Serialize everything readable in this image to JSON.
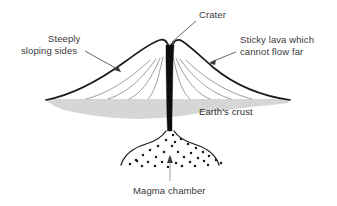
{
  "figure": {
    "background_color": "#ffffff",
    "width": 337,
    "height": 206
  },
  "labels": {
    "crater": "Crater",
    "steeply_line1": "Steeply",
    "steeply_line2": "sloping sides",
    "sticky_line1": "Sticky lava which",
    "sticky_line2": "cannot flow far",
    "earths_crust": "Earth's crust",
    "magma_chamber": "Magma chamber"
  },
  "colors": {
    "outline": "#1a1a1a",
    "crust_fill": "#d6d6d6",
    "vent_fill": "#0d0d0d",
    "layer_line": "#7d7d7d",
    "leader_line": "#8c8c8c",
    "text": "#3a3a3a"
  },
  "parts": {
    "cone_name": "volcano-cone",
    "vent_name": "volcanic-vent-conduit",
    "crust_name": "earths-crust-band",
    "chamber_name": "magma-chamber",
    "layers_name": "lava-layer-lines"
  },
  "magma_dots": [
    [
      173,
      135
    ],
    [
      166,
      140
    ],
    [
      181,
      139
    ],
    [
      158,
      146
    ],
    [
      172,
      146
    ],
    [
      188,
      144
    ],
    [
      196,
      148
    ],
    [
      150,
      150
    ],
    [
      164,
      152
    ],
    [
      178,
      152
    ],
    [
      191,
      153
    ],
    [
      203,
      152
    ],
    [
      143,
      155
    ],
    [
      156,
      157
    ],
    [
      170,
      158
    ],
    [
      184,
      157
    ],
    [
      198,
      158
    ],
    [
      209,
      156
    ],
    [
      136,
      160
    ],
    [
      148,
      162
    ],
    [
      162,
      162
    ],
    [
      176,
      163
    ],
    [
      190,
      162
    ],
    [
      204,
      161
    ],
    [
      216,
      160
    ],
    [
      130,
      164
    ],
    [
      142,
      166
    ],
    [
      155,
      166
    ],
    [
      168,
      167
    ],
    [
      182,
      166
    ],
    [
      195,
      166
    ],
    [
      208,
      165
    ],
    [
      221,
      163
    ],
    [
      137,
      161
    ],
    [
      175,
      142
    ]
  ]
}
